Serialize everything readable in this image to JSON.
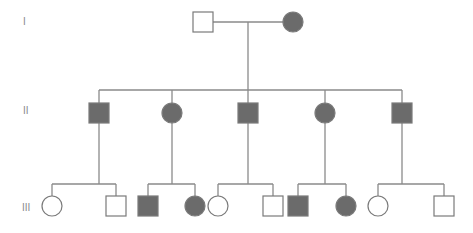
{
  "diagram": {
    "type": "pedigree",
    "colors": {
      "affected": "#6b6b6b",
      "unaffected": "#ffffff",
      "stroke": "#7a7a7a",
      "line": "#8a8a8a"
    },
    "generations": [
      {
        "label": "I",
        "y": 22
      },
      {
        "label": "II",
        "y": 113
      },
      {
        "label": "III",
        "y": 206
      }
    ],
    "individuals": [
      {
        "id": "I-1",
        "sex": "male",
        "affected": false,
        "x": 203,
        "y": 22
      },
      {
        "id": "I-2",
        "sex": "female",
        "affected": true,
        "x": 293,
        "y": 22
      },
      {
        "id": "II-1",
        "sex": "male",
        "affected": true,
        "x": 99,
        "y": 113
      },
      {
        "id": "II-2",
        "sex": "female",
        "affected": true,
        "x": 172,
        "y": 113
      },
      {
        "id": "II-3",
        "sex": "male",
        "affected": true,
        "x": 248,
        "y": 113
      },
      {
        "id": "II-4",
        "sex": "female",
        "affected": true,
        "x": 325,
        "y": 113
      },
      {
        "id": "II-5",
        "sex": "male",
        "affected": true,
        "x": 402,
        "y": 113
      },
      {
        "id": "III-1",
        "sex": "female",
        "affected": false,
        "x": 52,
        "y": 206
      },
      {
        "id": "III-2",
        "sex": "male",
        "affected": false,
        "x": 116,
        "y": 206
      },
      {
        "id": "III-3",
        "sex": "male",
        "affected": true,
        "x": 148,
        "y": 206
      },
      {
        "id": "III-4",
        "sex": "female",
        "affected": true,
        "x": 195,
        "y": 206
      },
      {
        "id": "III-5",
        "sex": "female",
        "affected": false,
        "x": 218,
        "y": 206
      },
      {
        "id": "III-6",
        "sex": "male",
        "affected": false,
        "x": 273,
        "y": 206
      },
      {
        "id": "III-7",
        "sex": "male",
        "affected": true,
        "x": 298,
        "y": 206
      },
      {
        "id": "III-8",
        "sex": "female",
        "affected": true,
        "x": 346,
        "y": 206
      },
      {
        "id": "III-9",
        "sex": "female",
        "affected": false,
        "x": 378,
        "y": 206
      },
      {
        "id": "III-10",
        "sex": "male",
        "affected": false,
        "x": 444,
        "y": 206
      }
    ]
  }
}
